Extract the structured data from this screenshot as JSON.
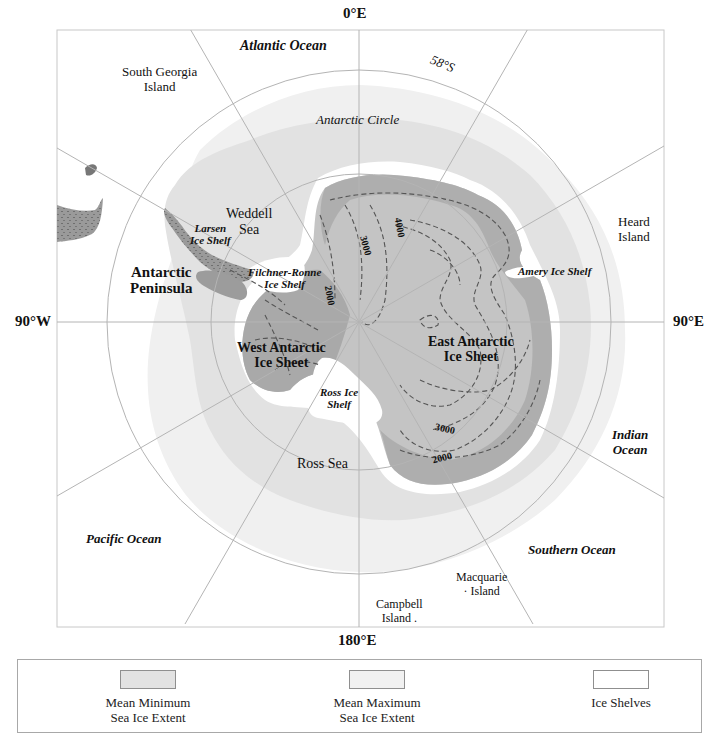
{
  "map": {
    "title": "Antarctica — Sea Ice Extent and Ice Sheets",
    "projection": "south-polar-stereographic",
    "meridian_labels": {
      "top": "0°E",
      "left": "90°W",
      "right": "90°E",
      "bottom": "180°E"
    },
    "latitude_labels": {
      "outer_circle": "58°S",
      "inner_circle": "Antarctic Circle"
    },
    "ocean_labels": {
      "atlantic": "Atlantic Ocean",
      "pacific": "Pacific Ocean",
      "indian": "Indian\nOcean",
      "southern": "Southern Ocean"
    },
    "sea_labels": {
      "weddell": "Weddell\nSea",
      "ross": "Ross Sea"
    },
    "island_labels": {
      "south_georgia": "South Georgia\nIsland",
      "heard": "Heard\nIsland",
      "macquarie": "Macquarie\n· Island",
      "campbell": "Campbell\nIsland ."
    },
    "region_labels": {
      "peninsula": "Antarctic\nPeninsula",
      "west_sheet": "West Antarctic\nIce Sheet",
      "east_sheet": "East Antarctic\nIce Sheet"
    },
    "ice_shelf_labels": {
      "larsen": "Larsen\nIce Shelf",
      "filchner_ronne": "Filchner-Ronne\nIce Shelf",
      "ross": "Ross Ice\nShelf",
      "amery": "Amery Ice Shelf"
    },
    "contour_labels": [
      "2000",
      "3000",
      "4000",
      "3000",
      "2000"
    ],
    "colors": {
      "land": "#a9a9a9",
      "land_interior": "#c4c4c4",
      "mean_min_sea_ice": "#e0e0e0",
      "mean_max_sea_ice": "#efefef",
      "ice_shelves": "#ffffff",
      "ocean": "#ffffff",
      "graticule": "#b8b8b8",
      "contour": "#555555"
    }
  },
  "legend": {
    "items": [
      {
        "label": "Mean Minimum\nSea Ice Extent",
        "color": "#e2e2e2"
      },
      {
        "label": "Mean Maximum\nSea Ice Extent",
        "color": "#f1f1f1"
      },
      {
        "label": "Ice Shelves",
        "color": "#ffffff"
      }
    ]
  }
}
